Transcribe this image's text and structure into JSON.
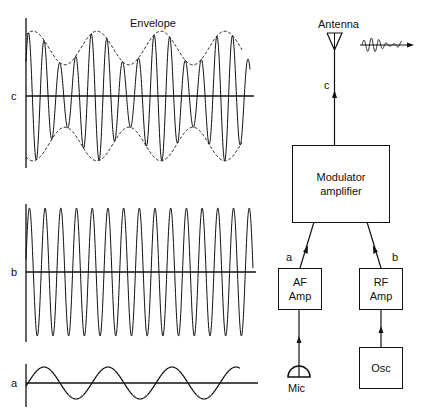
{
  "waveforms": {
    "c": {
      "label": "c",
      "title": "Envelope",
      "description": "Amplitude-modulated carrier with dashed envelope"
    },
    "b": {
      "label": "b",
      "description": "RF carrier sine wave"
    },
    "a": {
      "label": "a",
      "description": "Audio-frequency modulating signal"
    }
  },
  "block_diagram": {
    "antenna": {
      "label": "Antenna"
    },
    "modulator": {
      "line1": "Modulator",
      "line2": "amplifier"
    },
    "af_amp": {
      "line1": "AF",
      "line2": "Amp"
    },
    "rf_amp": {
      "line1": "RF",
      "line2": "Amp"
    },
    "osc": {
      "label": "Osc"
    },
    "mic": {
      "label": "Mic"
    },
    "links": {
      "c": "c",
      "a": "a",
      "b": "b"
    }
  },
  "colors": {
    "line": "#111111",
    "background": "#ffffff"
  }
}
